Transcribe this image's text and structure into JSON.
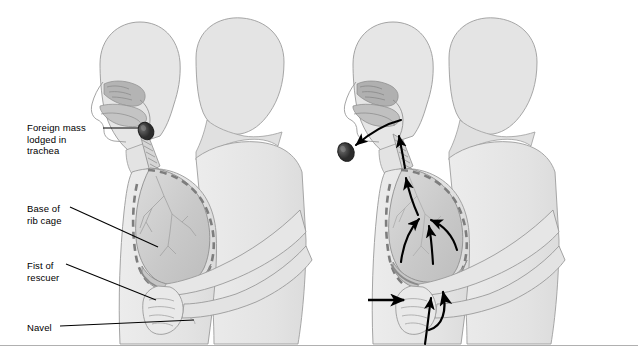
{
  "figure": {
    "background_color": "#ffffff",
    "width": 638,
    "height": 359,
    "bottom_rule": true
  },
  "palette": {
    "body_fill": "#e8e8e8",
    "body_stroke": "#9a9a9a",
    "head_fill": "#e4e4e4",
    "rescuer_fill": "#e2e2e2",
    "lung_fill": "#cfcfcf",
    "lung_stroke": "#8e8e8e",
    "cavity_fill": "#b9b9b9",
    "ribcage_dash": "#7d7d7d",
    "diaphragm": "#bcbcbc",
    "trachea": "#d5d5d5",
    "mass_fill": "#3a3a3a",
    "arrow_color": "#000000",
    "leader_color": "#000000",
    "text_color": "#000000",
    "rule_color": "#b0b0b0"
  },
  "labels": {
    "foreign_mass": "Foreign mass\nlodged in\ntrachea",
    "base_rib_cage": "Base of\nrib cage",
    "fist_of_rescuer": "Fist of\nrescuer",
    "navel": "Navel"
  },
  "panels": [
    {
      "id": "left",
      "name": "obstruction-panel",
      "caption": "Foreign mass lodged in trachea; rescuer's fist positioned above navel below rib cage",
      "shows_mass_in_trachea": true,
      "shows_expulsion": false,
      "arrows": []
    },
    {
      "id": "right",
      "name": "thrust-panel",
      "caption": "Inward and upward thrust forces air up from the diaphragm, expelling the foreign mass",
      "shows_mass_in_trachea": false,
      "shows_expulsion": true,
      "arrows": [
        {
          "name": "thrust-arrow",
          "type": "straight",
          "direction": "inward"
        },
        {
          "name": "upward-thrust-arrow",
          "type": "curved",
          "direction": "upward"
        },
        {
          "name": "diaphragm-arrow",
          "type": "straight",
          "direction": "up"
        },
        {
          "name": "airflow-arrow-left",
          "type": "curved",
          "direction": "up"
        },
        {
          "name": "airflow-arrow-right",
          "type": "curved",
          "direction": "up"
        },
        {
          "name": "airflow-arrow-center",
          "type": "straight",
          "direction": "up"
        },
        {
          "name": "trachea-airflow-arrow",
          "type": "straight",
          "direction": "up"
        },
        {
          "name": "expulsion-arrow",
          "type": "curved",
          "direction": "out-of-mouth"
        }
      ]
    }
  ],
  "anatomy": [
    {
      "name": "head-profile",
      "label": "Head in profile"
    },
    {
      "name": "nasal-cavity",
      "label": "Nasal cavity"
    },
    {
      "name": "oral-cavity",
      "label": "Oral cavity"
    },
    {
      "name": "trachea",
      "label": "Trachea"
    },
    {
      "name": "lung",
      "label": "Lung"
    },
    {
      "name": "bronchial-tree",
      "label": "Bronchial tree"
    },
    {
      "name": "rib-cage-outline",
      "label": "Base of rib cage"
    },
    {
      "name": "diaphragm",
      "label": "Diaphragm"
    },
    {
      "name": "foreign-mass",
      "label": "Foreign mass"
    },
    {
      "name": "rescuer-arms",
      "label": "Rescuer's arms"
    },
    {
      "name": "rescuer-fist",
      "label": "Rescuer's fist"
    },
    {
      "name": "navel",
      "label": "Navel"
    }
  ]
}
